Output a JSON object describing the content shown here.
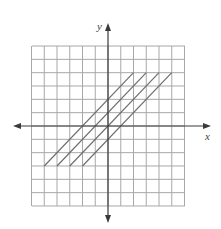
{
  "chart_data": {
    "type": "line",
    "title": "",
    "xlabel": "x",
    "ylabel": "y",
    "xlim": [
      -6,
      6
    ],
    "ylim": [
      -6,
      6
    ],
    "grid": true,
    "grid_step": 1,
    "legend": null,
    "series": [
      {
        "name": "y = x + 2",
        "x": [
          -5,
          2
        ],
        "y": [
          -3,
          4
        ]
      },
      {
        "name": "y = x + 1",
        "x": [
          -4,
          3
        ],
        "y": [
          -3,
          4
        ]
      },
      {
        "name": "y = x",
        "x": [
          -3,
          4
        ],
        "y": [
          -3,
          4
        ]
      },
      {
        "name": "y = x - 1",
        "x": [
          -2,
          5
        ],
        "y": [
          -3,
          4
        ]
      }
    ]
  },
  "labels": {
    "x_axis": "x",
    "y_axis": "y"
  },
  "colors": {
    "grid": "#a8a8a8",
    "axis": "#3a3a3a",
    "series": "#6e6e6e"
  },
  "layout": {
    "origin_px": [
      108,
      126
    ],
    "cell_w": 12.75,
    "cell_h": 13.33,
    "grid_left": 32,
    "grid_right": 185,
    "grid_top": 46,
    "grid_bottom": 206,
    "x_axis_left": 13,
    "x_axis_right": 211,
    "y_axis_top": 23,
    "y_axis_bottom": 223
  }
}
